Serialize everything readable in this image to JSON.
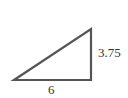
{
  "diagram": {
    "shape": "right-triangle",
    "stroke_color": "#555555",
    "labels": {
      "vertical_side": "3.75",
      "base": "6"
    }
  }
}
